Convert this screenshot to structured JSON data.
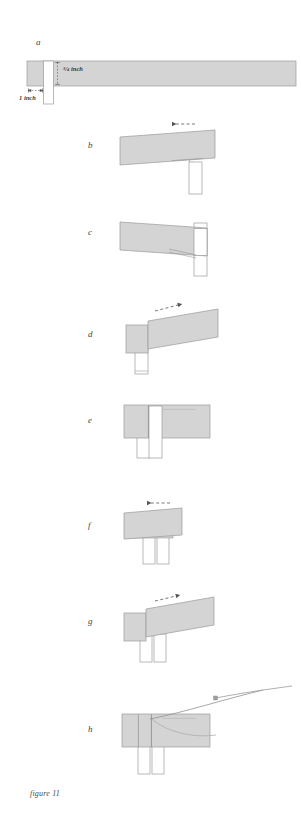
{
  "figure": {
    "caption": "figure 11",
    "background_color": "#ffffff",
    "wood_fill": "#d4d4d4",
    "wood_stroke": "#9a9a9a",
    "cut_fill": "#ffffff",
    "arrow_color": "#555555",
    "label_color": "#3b3b3b"
  },
  "dimensions": {
    "height_label": "3/4 inch",
    "height_numerator": "3",
    "height_denominator": "4",
    "height_unit": "inch",
    "width_label": "1 inch"
  },
  "panels": [
    {
      "id": "a",
      "letter": "a",
      "description": "long board with narrow vertical notch cut near the left end, dimensions marked"
    },
    {
      "id": "b",
      "letter": "b",
      "description": "board tilted with left-pointing dashed arrow, tenon projecting below right end"
    },
    {
      "id": "c",
      "letter": "c",
      "description": "board tilted down to the right, vertical member at right side"
    },
    {
      "id": "d",
      "letter": "d",
      "description": "board with right-pointing dashed arrow, leg below left end"
    },
    {
      "id": "e",
      "letter": "e",
      "description": "board level with vertical post passing through the joint"
    },
    {
      "id": "f",
      "letter": "f",
      "description": "shorter board with left-pointing dashed arrow and two legs below"
    },
    {
      "id": "g",
      "letter": "g",
      "description": "board tilted with right-pointing dashed arrow and two legs below"
    },
    {
      "id": "h",
      "letter": "h",
      "description": "completed joint with curved saw blade entering from upper right"
    }
  ],
  "arrows": [
    {
      "panel": "b",
      "direction": "left",
      "style": "dashed"
    },
    {
      "panel": "d",
      "direction": "right",
      "style": "dashed"
    },
    {
      "panel": "f",
      "direction": "left",
      "style": "dashed"
    },
    {
      "panel": "g",
      "direction": "right",
      "style": "dashed"
    }
  ]
}
